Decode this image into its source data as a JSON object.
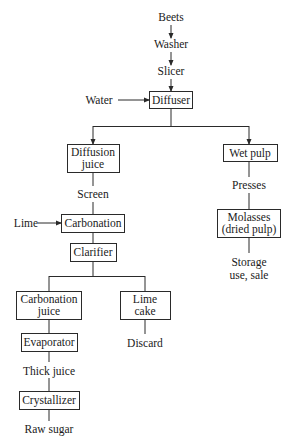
{
  "diagram": {
    "type": "process-flowchart",
    "nodes": {
      "beets": {
        "label": "Beets",
        "boxed": false
      },
      "washer": {
        "label": "Washer",
        "boxed": false
      },
      "slicer": {
        "label": "Slicer",
        "boxed": false
      },
      "water": {
        "label": "Water",
        "boxed": false
      },
      "diffuser": {
        "label": "Diffuser",
        "boxed": true
      },
      "diffusion_juice": {
        "line1": "Diffusion",
        "line2": "juice",
        "boxed": true
      },
      "wet_pulp": {
        "label": "Wet pulp",
        "boxed": true
      },
      "screen": {
        "label": "Screen",
        "boxed": false
      },
      "presses": {
        "label": "Presses",
        "boxed": false
      },
      "lime": {
        "label": "Lime",
        "boxed": false
      },
      "carbonation": {
        "label": "Carbonation",
        "boxed": true
      },
      "molasses": {
        "line1": "Molasses",
        "line2": "(dried pulp)",
        "boxed": true
      },
      "clarifier": {
        "label": "Clarifier",
        "boxed": true
      },
      "storage": {
        "line1": "Storage",
        "line2": "use, sale",
        "boxed": false
      },
      "carbonation_juice": {
        "line1": "Carbonation",
        "line2": "juice",
        "boxed": true
      },
      "lime_cake": {
        "line1": "Lime",
        "line2": "cake",
        "boxed": true
      },
      "evaporator": {
        "label": "Evaporator",
        "boxed": true
      },
      "discard": {
        "label": "Discard",
        "boxed": false
      },
      "thick_juice": {
        "label": "Thick juice",
        "boxed": false
      },
      "crystallizer": {
        "label": "Crystallizer",
        "boxed": true
      },
      "raw_sugar": {
        "label": "Raw sugar",
        "boxed": false
      }
    },
    "edges": [
      {
        "from": "Beets",
        "to": "Washer",
        "arrow": true
      },
      {
        "from": "Washer",
        "to": "Slicer",
        "arrow": true
      },
      {
        "from": "Slicer",
        "to": "Diffuser",
        "arrow": true
      },
      {
        "from": "Water",
        "to": "Diffuser",
        "arrow": true
      },
      {
        "from": "Diffuser",
        "to": "Diffusion juice",
        "arrow": true
      },
      {
        "from": "Diffuser",
        "to": "Wet pulp",
        "arrow": true
      },
      {
        "from": "Diffusion juice",
        "to": "Screen",
        "arrow": false
      },
      {
        "from": "Screen",
        "to": "Carbonation",
        "arrow": false
      },
      {
        "from": "Lime",
        "to": "Carbonation",
        "arrow": true
      },
      {
        "from": "Carbonation",
        "to": "Clarifier",
        "arrow": false
      },
      {
        "from": "Clarifier",
        "to": "Carbonation juice",
        "arrow": false
      },
      {
        "from": "Clarifier",
        "to": "Lime cake",
        "arrow": false
      },
      {
        "from": "Carbonation juice",
        "to": "Evaporator",
        "arrow": false
      },
      {
        "from": "Evaporator",
        "to": "Thick juice",
        "arrow": false
      },
      {
        "from": "Thick juice",
        "to": "Crystallizer",
        "arrow": false
      },
      {
        "from": "Crystallizer",
        "to": "Raw sugar",
        "arrow": false
      },
      {
        "from": "Lime cake",
        "to": "Discard",
        "arrow": false
      },
      {
        "from": "Wet pulp",
        "to": "Presses",
        "arrow": false
      },
      {
        "from": "Presses",
        "to": "Molasses (dried pulp)",
        "arrow": false
      },
      {
        "from": "Molasses (dried pulp)",
        "to": "Storage use, sale",
        "arrow": false
      }
    ]
  }
}
